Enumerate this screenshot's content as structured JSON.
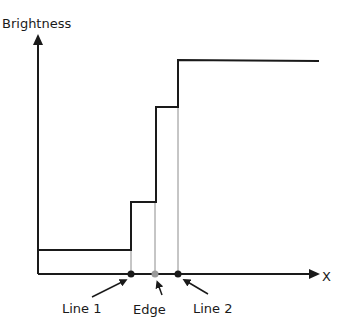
{
  "diagram": {
    "y_axis_label": "Brightness",
    "x_axis_label": "X",
    "annotations": [
      {
        "id": "line1",
        "label": "Line 1"
      },
      {
        "id": "edge",
        "label": "Edge"
      },
      {
        "id": "line2",
        "label": "Line 2"
      }
    ],
    "colors": {
      "stroke": "#1a1a1a",
      "guide": "#8c8c8c",
      "edge_marker": "#9a9a9a"
    }
  }
}
